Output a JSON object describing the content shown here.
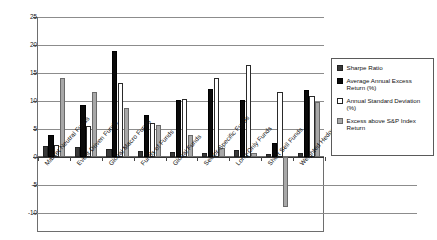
{
  "chart_data": {
    "type": "bar",
    "title": "",
    "xlabel": "",
    "ylabel": "",
    "ylim": [
      -10,
      25
    ],
    "yticks": [
      25,
      20,
      15,
      10,
      5,
      0,
      -5,
      -10
    ],
    "grid": true,
    "legend_position": "right",
    "categories": [
      "Market Neutral Funds",
      "Event Driven Funds",
      "Global Macro Funds",
      "Funds of Funds",
      "Global Funds",
      "Sector-Specific Funds",
      "Long-Only Funds",
      "Short Sell Funds",
      "Weighted Hedge Funds"
    ],
    "series": [
      {
        "name": "Sharpe Ratio",
        "color": "#3a3a3a",
        "values": [
          2.0,
          1.7,
          1.4,
          1.1,
          0.9,
          0.7,
          1.3,
          0.6,
          0.8
        ]
      },
      {
        "name": "Average Annual Excess Return (%)",
        "color": "#0a0a0a",
        "values": [
          3.9,
          9.3,
          18.9,
          7.5,
          10.1,
          12.1,
          10.2,
          2.5,
          12.0
        ]
      },
      {
        "name": "Annual Standard Deviation (%)",
        "color": "#ffffff",
        "values": [
          2.2,
          5.6,
          13.3,
          6.1,
          10.3,
          14.1,
          16.4,
          11.6,
          10.9
        ]
      },
      {
        "name": "Excess above S&P Index Return",
        "color": "#a8a8a8",
        "values": [
          14.1,
          11.6,
          8.7,
          5.8,
          4.0,
          1.6,
          0.7,
          -9.0,
          9.8
        ]
      }
    ]
  },
  "legend": {
    "items": [
      "Sharpe Ratio",
      "Average Annual Excess Return (%)",
      "Annual Standard Deviation (%)",
      "Excess above S&P Index Return"
    ]
  }
}
